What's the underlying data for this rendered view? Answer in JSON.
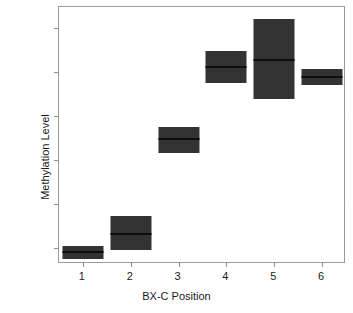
{
  "chart_data": {
    "type": "bar",
    "title": "",
    "xlabel": "BX-C Position",
    "ylabel": "Methylation Level",
    "categories": [
      "1",
      "2",
      "3",
      "4",
      "5",
      "6"
    ],
    "xtick_labels": [
      "1",
      "2",
      "3",
      "4",
      "5",
      "6"
    ],
    "ytick_labels": [
      "0.2",
      "0.4",
      "0.6",
      "0.8",
      "1.0",
      "1.2"
    ],
    "ytick_values": [
      0.2,
      0.4,
      0.6,
      0.8,
      1.0,
      1.2
    ],
    "ylim": [
      0.127,
      1.296
    ],
    "xlim": [
      0.5,
      6.5
    ],
    "grid": false,
    "legend": null,
    "series": [
      {
        "name": "Methylation Level",
        "marker": "filled-rectangle-with-median-line",
        "color": "#333333",
        "median_color": "#0d0d0d",
        "values": [
          0.182,
          0.264,
          0.695,
          1.023,
          1.055,
          0.977
        ],
        "ranges": [
          {
            "position": "1",
            "low": 0.15,
            "median": 0.182,
            "high": 0.209
          },
          {
            "position": "2",
            "low": 0.191,
            "median": 0.264,
            "high": 0.345
          },
          {
            "position": "3",
            "low": 0.632,
            "median": 0.695,
            "high": 0.75
          },
          {
            "position": "4",
            "low": 0.95,
            "median": 1.023,
            "high": 1.095
          },
          {
            "position": "5",
            "low": 0.877,
            "median": 1.055,
            "high": 1.241
          },
          {
            "position": "6",
            "low": 0.941,
            "median": 0.977,
            "high": 1.014
          }
        ]
      }
    ]
  },
  "style": {
    "frame_color": "#9a9a9a",
    "tick_color": "#8f8f8f",
    "text_color": "#1a1a1a",
    "background": "#ffffff",
    "box_fill": "#333333"
  }
}
